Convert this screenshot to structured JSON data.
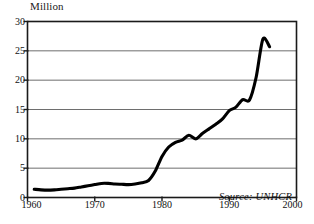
{
  "chart_data": {
    "type": "line",
    "title": "",
    "subtitle": "",
    "ylabel": "Million",
    "xlabel": "",
    "xlim": [
      1960,
      2000
    ],
    "ylim": [
      0,
      30
    ],
    "grid": "horizontal",
    "legend": "none",
    "source_note": "Source: UNHCR",
    "xticks": [
      1960,
      1970,
      1980,
      1990,
      2000
    ],
    "yticks": [
      0,
      5,
      10,
      15,
      20,
      25,
      30
    ],
    "xtick_labels": [
      "1960",
      "1970",
      "1980",
      "1990",
      "2000"
    ],
    "ytick_labels": [
      "0",
      "5",
      "10",
      "15",
      "20",
      "25",
      "30"
    ],
    "series": [
      {
        "name": "Refugees",
        "color": "#000000",
        "x": [
          1961,
          1962,
          1963,
          1964,
          1965,
          1966,
          1967,
          1968,
          1969,
          1970,
          1971,
          1972,
          1973,
          1974,
          1975,
          1976,
          1977,
          1978,
          1979,
          1980,
          1981,
          1982,
          1983,
          1984,
          1985,
          1986,
          1987,
          1988,
          1989,
          1990,
          1991,
          1992,
          1993,
          1994,
          1995,
          1996
        ],
        "values": [
          1.4,
          1.3,
          1.25,
          1.3,
          1.4,
          1.5,
          1.6,
          1.8,
          2.0,
          2.2,
          2.4,
          2.4,
          2.3,
          2.25,
          2.2,
          2.3,
          2.5,
          2.9,
          4.5,
          7.0,
          8.6,
          9.4,
          9.8,
          10.6,
          10.0,
          10.9,
          11.7,
          12.5,
          13.4,
          14.8,
          15.4,
          16.7,
          16.6,
          20.5,
          27.0,
          25.7
        ]
      }
    ]
  },
  "figure": {
    "axis_title": "Million",
    "source_note": "Source: UNHCR"
  }
}
